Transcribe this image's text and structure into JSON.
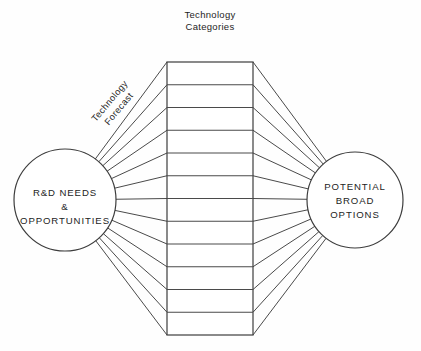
{
  "diagram": {
    "title_lines": [
      "Technology",
      "Categories"
    ],
    "left_node": {
      "label_lines": [
        "R&D NEEDS",
        "&",
        "OPPORTUNITIES"
      ],
      "shape": "circle",
      "cx": 65,
      "cy": 200,
      "r": 51
    },
    "right_node": {
      "label_lines": [
        "POTENTIAL",
        "BROAD",
        "OPTIONS"
      ],
      "shape": "circle",
      "cx": 355,
      "cy": 200,
      "r": 48
    },
    "center_stack": {
      "x": 167,
      "y": 62,
      "width": 86,
      "height": 273,
      "row_count": 12
    },
    "flow_label": {
      "lines": [
        "Technology",
        "Forecast"
      ],
      "rotation_deg": -50,
      "x": 112,
      "y": 103
    },
    "colors": {
      "background": "#fefefe",
      "stroke": "#3d3d3d",
      "connector": "#4a4a4a",
      "text": "#1d1d1d",
      "fill": "#ffffff"
    }
  }
}
